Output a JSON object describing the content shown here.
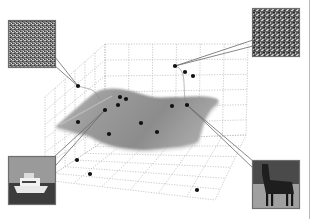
{
  "figure": {
    "width": 312,
    "height": 219,
    "colors": {
      "background": "#ffffff",
      "grid": "#bdbdbd",
      "surface_light": "#b4b4b4",
      "surface_dark": "#8e8e8e",
      "point": "#111111",
      "leader": "#6a6a6a",
      "thumb_border": "#6e6e6e",
      "right_rule": "#b8b8b8"
    },
    "box": {
      "back_top_left": [
        105,
        44
      ],
      "back_top_right": [
        248,
        44
      ],
      "back_bottom_left": [
        105,
        140
      ],
      "back_bottom_right": [
        246,
        135
      ],
      "front_top_left": [
        45,
        97
      ],
      "front_bottom_left": [
        45,
        180
      ],
      "front_bottom_right": [
        215,
        200
      ],
      "grid_divisions": 6
    },
    "surface": {
      "outline": [
        [
          55,
          127
        ],
        [
          72,
          112
        ],
        [
          88,
          98
        ],
        [
          98,
          90
        ],
        [
          113,
          88
        ],
        [
          128,
          90
        ],
        [
          138,
          93
        ],
        [
          155,
          98
        ],
        [
          168,
          97
        ],
        [
          182,
          97
        ],
        [
          198,
          96
        ],
        [
          212,
          97
        ],
        [
          220,
          100
        ],
        [
          216,
          105
        ],
        [
          212,
          108
        ],
        [
          206,
          117
        ],
        [
          203,
          125
        ],
        [
          200,
          135
        ],
        [
          198,
          143
        ],
        [
          180,
          147
        ],
        [
          165,
          148
        ],
        [
          150,
          150
        ],
        [
          138,
          150
        ],
        [
          122,
          148
        ],
        [
          108,
          145
        ],
        [
          96,
          140
        ],
        [
          88,
          135
        ],
        [
          68,
          132
        ]
      ]
    },
    "points": [
      {
        "x": 78,
        "y": 86,
        "linked": "noise-top-left"
      },
      {
        "x": 175,
        "y": 66,
        "linked": "noise-top-right"
      },
      {
        "x": 185,
        "y": 72
      },
      {
        "x": 193,
        "y": 76
      },
      {
        "x": 120,
        "y": 97
      },
      {
        "x": 126,
        "y": 99
      },
      {
        "x": 118,
        "y": 105
      },
      {
        "x": 105,
        "y": 110,
        "linked": "boat"
      },
      {
        "x": 172,
        "y": 106
      },
      {
        "x": 187,
        "y": 105,
        "linked": "horse"
      },
      {
        "x": 78,
        "y": 122
      },
      {
        "x": 141,
        "y": 123
      },
      {
        "x": 109,
        "y": 134
      },
      {
        "x": 157,
        "y": 132
      },
      {
        "x": 77,
        "y": 160
      },
      {
        "x": 90,
        "y": 174
      },
      {
        "x": 197,
        "y": 190
      }
    ],
    "drop_curves": [
      {
        "from": [
          78,
          86
        ],
        "to": [
          100,
          100
        ]
      },
      {
        "from": [
          175,
          66
        ],
        "to": [
          187,
          105
        ]
      }
    ],
    "thumbnails": [
      {
        "id": "noise-top-left",
        "label": "random noise image",
        "x": 8,
        "y": 20,
        "w": 48,
        "h": 48,
        "kind": "noise",
        "anchor_a": [
          55,
          57
        ],
        "anchor_b": [
          55,
          66
        ],
        "point": [
          78,
          86
        ]
      },
      {
        "id": "noise-top-right",
        "label": "random noise image",
        "x": 252,
        "y": 8,
        "w": 48,
        "h": 49,
        "kind": "noise",
        "anchor_a": [
          253,
          40
        ],
        "anchor_b": [
          253,
          46
        ],
        "point": [
          175,
          66
        ]
      },
      {
        "id": "boat",
        "label": "photo of a motor yacht",
        "x": 8,
        "y": 156,
        "w": 48,
        "h": 49,
        "kind": "boat",
        "anchor_a": [
          54,
          157
        ],
        "anchor_b": [
          56,
          165
        ],
        "point": [
          105,
          110
        ]
      },
      {
        "id": "horse",
        "label": "photo of a horse",
        "x": 252,
        "y": 160,
        "w": 48,
        "h": 49,
        "kind": "horse",
        "anchor_a": [
          253,
          161
        ],
        "anchor_b": [
          253,
          168
        ],
        "point": [
          187,
          105
        ]
      }
    ]
  }
}
